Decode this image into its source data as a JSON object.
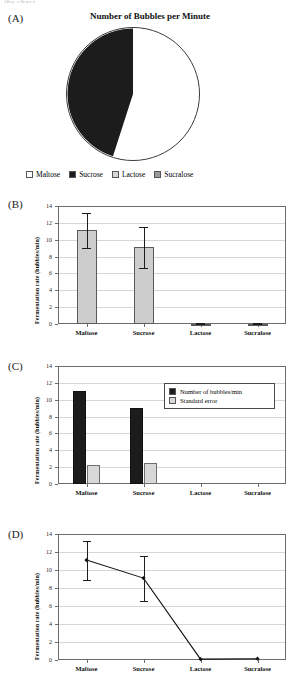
{
  "page": {
    "cutoff_text": "the chart.",
    "panel_labels": {
      "a": "(A)",
      "b": "(B)",
      "c": "(C)",
      "d": "(D)"
    }
  },
  "colors": {
    "maltose": "#ffffff",
    "sucrose": "#1c1c1c",
    "lactose": "#d8d8d8",
    "sucralose": "#9a9a9a",
    "bar_gray": "#cdcdcd",
    "bar_black": "#1c1c1c",
    "grid": "#d6d6d6",
    "axis": "#4a4a4a"
  },
  "chart_data": [
    {
      "id": "A",
      "type": "pie",
      "title": "Number of Bubbles per Minute",
      "labels": [
        "Maltose",
        "Sucrose",
        "Lactose",
        "Sucralose"
      ],
      "values": [
        11.1,
        9.1,
        0.0,
        0.0
      ],
      "percentages": [
        54.9,
        45.1,
        0.0,
        0.0
      ],
      "slice_colors": [
        "#ffffff",
        "#1c1c1c",
        "#d8d8d8",
        "#9a9a9a"
      ],
      "legend": {
        "position": "bottom",
        "entries": [
          {
            "label": "Maltose",
            "color": "#ffffff"
          },
          {
            "label": "Sucrose",
            "color": "#1c1c1c"
          },
          {
            "label": "Lactose",
            "color": "#d8d8d8"
          },
          {
            "label": "Sucralose",
            "color": "#9a9a9a"
          }
        ]
      }
    },
    {
      "id": "B",
      "type": "bar",
      "title": "",
      "xlabel": "",
      "ylabel": "Fermentation rate (bubbles/min)",
      "categories": [
        "Maltose",
        "Sucrose",
        "Lactose",
        "Sucralose"
      ],
      "values": [
        11.1,
        9.1,
        0.05,
        0.05
      ],
      "errors": [
        2.1,
        2.45,
        0.05,
        0.05
      ],
      "error_low": [
        9.0,
        6.65,
        0.0,
        0.0
      ],
      "error_high": [
        13.2,
        11.55,
        0.1,
        0.1
      ],
      "ylim": [
        0,
        14
      ],
      "yticks": [
        0,
        2,
        4,
        6,
        8,
        10,
        12,
        14
      ],
      "ytick_labels": [
        "0",
        "2",
        "4",
        "6",
        "8",
        "10",
        "12",
        "14"
      ],
      "grid": true,
      "legend": null,
      "bar_color": "#cdcdcd"
    },
    {
      "id": "C",
      "type": "bar",
      "title": "",
      "xlabel": "",
      "ylabel": "Fermentation rate (bubbles/min)",
      "categories": [
        "Maltose",
        "Sucrose",
        "Lactose",
        "Sucralose"
      ],
      "series": [
        {
          "name": "Number of bubbles/min",
          "color": "#1c1c1c",
          "values": [
            11.05,
            9.05,
            0.0,
            0.0
          ]
        },
        {
          "name": "Standard error",
          "color": "#d8d8d8",
          "values": [
            2.2,
            2.45,
            0.0,
            0.0
          ]
        }
      ],
      "ylim": [
        0,
        14
      ],
      "yticks": [
        0,
        2,
        4,
        6,
        8,
        10,
        12,
        14
      ],
      "ytick_labels": [
        "0",
        "2",
        "4",
        "6",
        "8",
        "10",
        "12",
        "14"
      ],
      "grid": true,
      "legend": {
        "position": "top-right",
        "entries": [
          "Number of bubbles/min",
          "Standard error"
        ]
      }
    },
    {
      "id": "D",
      "type": "line",
      "title": "",
      "xlabel": "",
      "ylabel": "Fermentation rate (bubbles/min)",
      "categories": [
        "Maltose",
        "Sucrose",
        "Lactose",
        "Sucralose"
      ],
      "values": [
        11.1,
        9.1,
        0.1,
        0.15
      ],
      "error_low": [
        8.9,
        6.6,
        0.1,
        0.15
      ],
      "error_high": [
        13.2,
        11.6,
        0.1,
        0.15
      ],
      "ylim": [
        0,
        14
      ],
      "yticks": [
        0,
        2,
        4,
        6,
        8,
        10,
        12,
        14
      ],
      "ytick_labels": [
        "0",
        "2",
        "4",
        "6",
        "8",
        "10",
        "12",
        "14"
      ],
      "grid": true,
      "marker": "diamond",
      "line_color": "#111111",
      "legend": null
    }
  ]
}
